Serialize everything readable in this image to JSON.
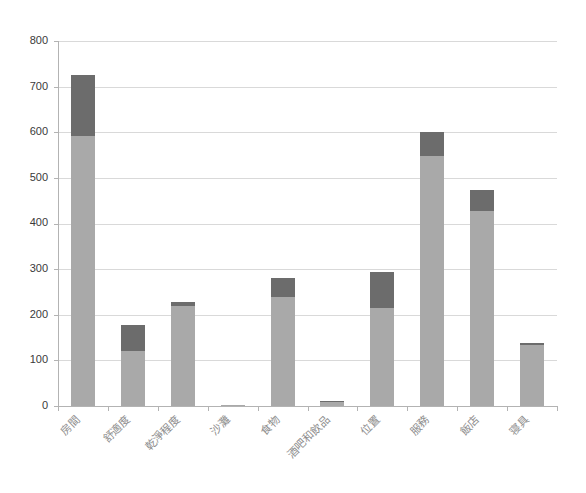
{
  "chart_data": {
    "type": "bar",
    "stacked": true,
    "title": "",
    "subtitle": "",
    "xlabel": "",
    "ylabel": "",
    "ylim": [
      0,
      800
    ],
    "ytick_values": [
      0,
      100,
      200,
      300,
      400,
      500,
      600,
      700,
      800
    ],
    "ytick_labels": [
      "0",
      "100",
      "200",
      "300",
      "400",
      "500",
      "600",
      "700",
      "800"
    ],
    "grid": true,
    "legend": false,
    "legend_position": "none",
    "categories": [
      "房間",
      "舒適度",
      "乾淨程度",
      "沙灘",
      "食物",
      "酒吧和飲品",
      "位置",
      "服務",
      "飯店",
      "寝具"
    ],
    "series": [
      {
        "name": "series-1",
        "color": "#a9a9a9",
        "values": [
          592,
          120,
          220,
          2,
          240,
          9,
          215,
          547,
          428,
          133
        ]
      },
      {
        "name": "series-2",
        "color": "#6c6c6c",
        "values": [
          133,
          57,
          9,
          0,
          41,
          1,
          78,
          54,
          45,
          6
        ]
      }
    ],
    "totals": [
      725,
      177,
      229,
      2,
      281,
      10,
      293,
      601,
      473,
      139
    ],
    "colors": {
      "series_1": "#a9a9a9",
      "series_2": "#6c6c6c",
      "gridline": "#d9d9d9",
      "axis": "#b3b3b3",
      "ytick_text": "#3a3a3a",
      "xtick_text": "#8d8d8d",
      "background": "#ffffff"
    }
  },
  "layout": {
    "plot_left": 58,
    "plot_right": 557,
    "plot_top": 41,
    "plot_bottom": 406,
    "bar_width": 24,
    "xlabel_rotation": -45
  }
}
